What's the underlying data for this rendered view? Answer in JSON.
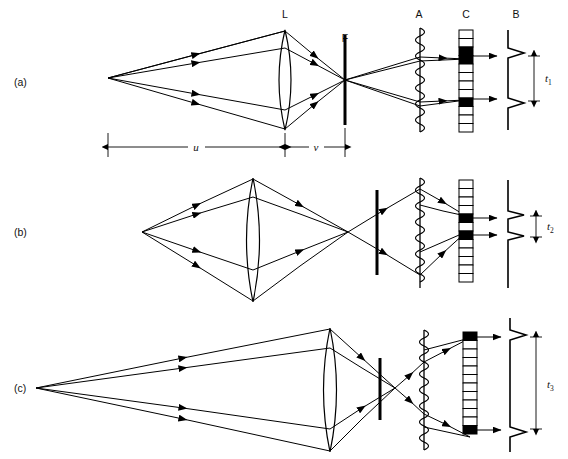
{
  "figure": {
    "background_color": "#ffffff",
    "ink_color": "#000000",
    "width": 568,
    "height": 459
  },
  "component_labels": [
    {
      "key": "L",
      "text": "L",
      "meaning": "lens",
      "x": 285,
      "y": 18
    },
    {
      "key": "F",
      "text": "F",
      "meaning": "field-stop-slit",
      "x": 345,
      "y": 42
    },
    {
      "key": "A",
      "text": "A",
      "meaning": "coil-aperture",
      "x": 418,
      "y": 18
    },
    {
      "key": "C",
      "text": "C",
      "meaning": "detector-cell-array",
      "x": 466,
      "y": 18
    },
    {
      "key": "B",
      "text": "B",
      "meaning": "output-signal-trace",
      "x": 516,
      "y": 18
    }
  ],
  "panels": [
    {
      "id": "a",
      "label": "(a)",
      "label_x": 14,
      "label_y": 82,
      "t_label": "t",
      "t_subscript": "1",
      "t_value_px": 56,
      "source_x": 108,
      "source_y": 78,
      "lens_x": 285,
      "lens_top": 30,
      "lens_bottom": 130,
      "stop_x": 345,
      "crossing_x": 345,
      "crossing_y": 80,
      "coil_x": 420,
      "array_x": 466,
      "trace_x": 508,
      "cell_on_indices": [
        2,
        7
      ],
      "cell_count": 12,
      "has_dimension_line": true
    },
    {
      "id": "b",
      "label": "(b)",
      "label_x": 14,
      "label_y": 232,
      "t_label": "t",
      "t_subscript": "2",
      "t_value_px": 26,
      "source_x": 142,
      "source_y": 232,
      "lens_x": 253,
      "lens_top": 178,
      "lens_bottom": 302,
      "stop_x": 377,
      "crossing_x": 348,
      "crossing_y": 232,
      "coil_x": 420,
      "array_x": 466,
      "trace_x": 508,
      "cell_on_indices": [
        4,
        6
      ],
      "cell_count": 12,
      "has_dimension_line": false
    },
    {
      "id": "c",
      "label": "(c)",
      "label_x": 14,
      "label_y": 388,
      "t_label": "t",
      "t_subscript": "3",
      "t_value_px": 92,
      "source_x": 36,
      "source_y": 388,
      "lens_x": 330,
      "lens_top": 328,
      "lens_bottom": 452,
      "stop_x": 380,
      "crossing_x": 395,
      "crossing_y": 388,
      "coil_x": 424,
      "array_x": 470,
      "trace_x": 510,
      "cell_on_indices": [
        0,
        11
      ],
      "cell_count": 12,
      "has_dimension_line": false
    }
  ],
  "dimensions": [
    {
      "key": "u",
      "text": "u",
      "meaning": "object-distance-source-to-lens",
      "from_x": 108,
      "to_x": 285,
      "y": 145,
      "label_x": 196,
      "label_y": 142
    },
    {
      "key": "v",
      "text": "v",
      "meaning": "image-distance-lens-to-stop",
      "from_x": 285,
      "to_x": 345,
      "y": 145,
      "label_x": 316,
      "label_y": 142
    }
  ],
  "t_labels": [
    {
      "panel": "a",
      "text": "t",
      "subscript": "1",
      "x": 543,
      "y": 84
    },
    {
      "panel": "b",
      "text": "t",
      "subscript": "2",
      "x": 548,
      "y": 236
    },
    {
      "panel": "c",
      "text": "t",
      "subscript": "3",
      "x": 545,
      "y": 392
    }
  ]
}
